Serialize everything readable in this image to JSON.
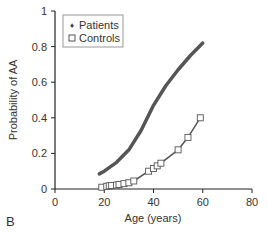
{
  "chart_data": {
    "type": "line",
    "panel_label": "B",
    "title": "",
    "xlabel": "Age (years)",
    "ylabel": "Probability of AA",
    "xlim": [
      0,
      80
    ],
    "ylim": [
      0,
      1
    ],
    "x_ticks": [
      "0",
      "20",
      "40",
      "60",
      "80"
    ],
    "y_ticks": [
      "0",
      "0.2",
      "0.4",
      "0.6",
      "0.8",
      "1"
    ],
    "grid": false,
    "legend_position": "upper-left",
    "series": [
      {
        "name": "Patients",
        "marker": "diamond-dense",
        "x": [
          18,
          20,
          25,
          30,
          35,
          40,
          45,
          50,
          55,
          60
        ],
        "y": [
          0.085,
          0.1,
          0.15,
          0.22,
          0.33,
          0.47,
          0.58,
          0.67,
          0.75,
          0.82
        ]
      },
      {
        "name": "Controls",
        "marker": "square-open",
        "x": [
          19,
          21,
          22,
          23,
          25,
          26,
          28,
          30,
          32,
          38,
          40,
          41.5,
          43,
          50,
          54,
          59
        ],
        "y": [
          0.01,
          0.015,
          0.018,
          0.02,
          0.022,
          0.025,
          0.03,
          0.035,
          0.045,
          0.1,
          0.115,
          0.13,
          0.145,
          0.22,
          0.29,
          0.4
        ]
      }
    ]
  },
  "legend": {
    "patients_label": "Patients",
    "controls_label": "Controls"
  }
}
